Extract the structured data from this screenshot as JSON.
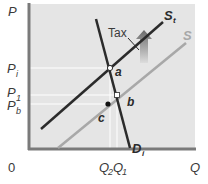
{
  "diagram": {
    "type": "supply-demand-tax",
    "axes": {
      "y_label": "P",
      "x_label": "Q",
      "origin_label": "0"
    },
    "price_labels": [
      {
        "id": "Pi",
        "main": "P",
        "sub": "i"
      },
      {
        "id": "P1",
        "main": "P",
        "sub": "1"
      },
      {
        "id": "Pb",
        "main": "P",
        "sub": "b"
      }
    ],
    "quantity_labels": [
      {
        "id": "Q2",
        "main": "Q",
        "sub": "2"
      },
      {
        "id": "Q1",
        "main": "Q",
        "sub": "1"
      }
    ],
    "curves": {
      "supply_after_tax": {
        "main": "S",
        "sub": "t",
        "color": "#2b2b2b"
      },
      "supply": {
        "main": "S",
        "color": "#a8a8a8"
      },
      "demand": {
        "main": "D",
        "sub": "i",
        "color": "#2b2b2b"
      }
    },
    "points": {
      "a": "a",
      "b": "b",
      "c": "c"
    },
    "annotation": {
      "tax_label": "Tax"
    },
    "colors": {
      "plot_bg": "#e6e6e6",
      "axis": "#7a7a7a",
      "gridline": "#ffffff",
      "arrow_top": "#6f6f6f",
      "arrow_bottom": "#d8d8d8"
    }
  }
}
